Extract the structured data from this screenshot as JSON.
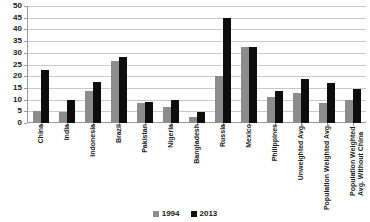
{
  "chart_data": {
    "type": "bar",
    "title": "",
    "subtitle": "",
    "xlabel": "",
    "ylabel": "",
    "ylim": [
      0,
      50
    ],
    "ytick_step": 5,
    "yticks": [
      "50",
      "45",
      "40",
      "35",
      "30",
      "25",
      "20",
      "15",
      "10",
      "5",
      "0"
    ],
    "grid": true,
    "grid_axis": "y",
    "legend_position": "bottom-center",
    "categories": [
      "China",
      "India",
      "Indonesia",
      "Brazil",
      "Pakistan",
      "Nigeria",
      "Bangladesh",
      "Russia",
      "Mexico",
      "Philippines",
      "Unweighted Avg.",
      "Population Weighted Avg.",
      "Population Weighted Avg. Without China"
    ],
    "series": [
      {
        "name": "1994",
        "color": "#8c8c8c",
        "values": [
          5,
          4.5,
          13.5,
          26.5,
          8.5,
          7,
          2.5,
          20,
          32.5,
          11,
          13,
          8.5,
          10
        ]
      },
      {
        "name": "2013",
        "color": "#0d0d0d",
        "values": [
          22.5,
          10,
          17.5,
          28,
          9,
          10,
          4.5,
          45,
          32.5,
          13.5,
          19,
          17,
          14.5
        ]
      }
    ]
  },
  "legend": {
    "items": [
      {
        "label": "1994",
        "color": "#8c8c8c"
      },
      {
        "label": "2013",
        "color": "#0d0d0d"
      }
    ]
  }
}
